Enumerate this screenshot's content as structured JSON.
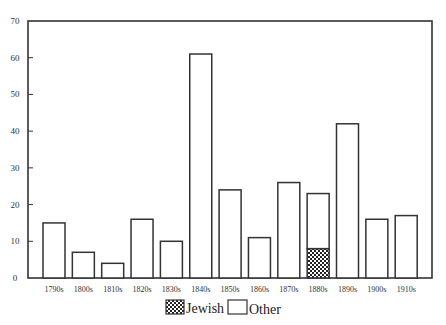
{
  "chart_data": {
    "type": "bar",
    "stacked": true,
    "title": "",
    "xlabel": "",
    "ylabel": "",
    "ylim": [
      0,
      70
    ],
    "yticks": [
      0,
      10,
      20,
      30,
      40,
      50,
      60,
      70
    ],
    "grid": false,
    "legend_position": "bottom-center",
    "categories": [
      "1790s",
      "1800s",
      "1810s",
      "1820s",
      "1830s",
      "1840s",
      "1850s",
      "1860s",
      "1870s",
      "1880s",
      "1890s",
      "1900s",
      "1910s"
    ],
    "series": [
      {
        "name": "Jewish",
        "pattern": "crosshatch",
        "values": [
          0,
          0,
          0,
          0,
          0,
          0,
          0,
          0,
          0,
          8,
          0,
          0,
          0
        ]
      },
      {
        "name": "Other",
        "pattern": "none",
        "values": [
          15,
          7,
          4,
          16,
          10,
          61,
          24,
          11,
          26,
          15,
          42,
          16,
          17
        ]
      }
    ],
    "totals": [
      15,
      7,
      4,
      16,
      10,
      61,
      24,
      11,
      26,
      23,
      42,
      16,
      17
    ]
  },
  "legend": {
    "items": [
      {
        "label": "Jewish",
        "swatch": "crosshatch"
      },
      {
        "label": "Other",
        "swatch": "empty"
      }
    ]
  },
  "colors": {
    "axis": "#333333",
    "bar_stroke": "#333333",
    "bar_fill": "#ffffff"
  }
}
